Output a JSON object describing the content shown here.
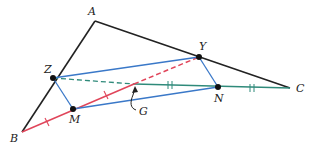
{
  "diagram": {
    "type": "triangle-midsegment-centroid",
    "colors": {
      "triangle": "#222222",
      "blue": "#3a78c8",
      "red": "#e0455a",
      "green": "#2f8a7a",
      "point": "#111111"
    },
    "points": {
      "A": {
        "label": "A",
        "x": 95,
        "y": 21,
        "lx": 88,
        "ly": 15
      },
      "B": {
        "label": "B",
        "x": 22,
        "y": 132,
        "lx": 10,
        "ly": 142
      },
      "C": {
        "label": "C",
        "x": 290,
        "y": 88,
        "lx": 296,
        "ly": 92
      },
      "Y": {
        "label": "Y",
        "x": 199,
        "y": 57,
        "lx": 199,
        "ly": 49
      },
      "Z": {
        "label": "Z",
        "x": 53,
        "y": 78,
        "lx": 44,
        "ly": 72
      },
      "M": {
        "label": "M",
        "x": 73,
        "y": 109,
        "lx": 69,
        "ly": 122
      },
      "N": {
        "label": "N",
        "x": 218,
        "y": 87,
        "lx": 215,
        "ly": 101
      },
      "G": {
        "label": "G",
        "x": 134,
        "y": 84,
        "lx": 140,
        "ly": 113
      }
    }
  }
}
